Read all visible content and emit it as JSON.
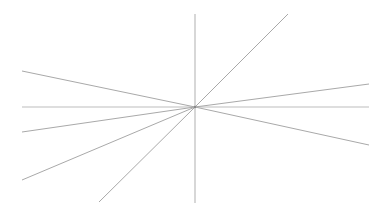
{
  "diagram": {
    "title": "",
    "line_color": "#a9a9a9",
    "axis_color": "#bdbdbd",
    "background": "#ffffff",
    "elements": [
      {
        "name": "horizontal-axis-line",
        "kind": "axis"
      },
      {
        "name": "vertical-axis-line",
        "kind": "axis"
      },
      {
        "name": "ray-upper-left-shallow",
        "kind": "ray"
      },
      {
        "name": "ray-lower-left-shallow",
        "kind": "ray"
      },
      {
        "name": "ray-lower-left-medium",
        "kind": "ray"
      },
      {
        "name": "ray-lower-left-steep",
        "kind": "ray"
      },
      {
        "name": "ray-upper-right-steep",
        "kind": "ray"
      },
      {
        "name": "ray-upper-right-shallow",
        "kind": "ray"
      },
      {
        "name": "ray-lower-right-shallow",
        "kind": "ray"
      }
    ]
  }
}
